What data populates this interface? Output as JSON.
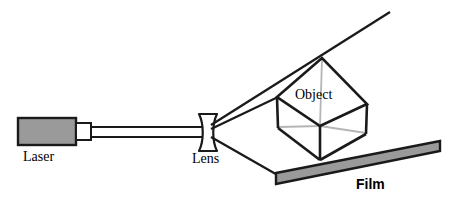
{
  "figure": {
    "width": 456,
    "height": 215,
    "background": "#ffffff"
  },
  "labels": {
    "laser": "Laser",
    "lens": "Lens",
    "object": "Object",
    "film": "Film"
  },
  "colors": {
    "stroke": "#1a1a1a",
    "laser_body_fill": "#9a9a9a",
    "film_fill": "#9a9a9a",
    "hidden_edge": "#b5b5b5",
    "nozzle_fill": "#ffffff",
    "background": "#ffffff"
  },
  "components": {
    "laser": {
      "name": "laser",
      "body": {
        "x": 17,
        "y": 117,
        "width": 60,
        "height": 29
      },
      "nozzle": {
        "x": 77,
        "y": 123,
        "width": 14,
        "height": 17
      },
      "beam_tube": {
        "x1": 91,
        "y1": 127,
        "x2": 200,
        "y2": 137
      }
    },
    "lens": {
      "name": "diverging-lens",
      "center_x": 208,
      "top_y": 113,
      "bottom_y": 152,
      "cap_half_width": 9,
      "waist_half_width": 3
    },
    "object": {
      "name": "cube-object",
      "shape": "isometric-cube",
      "top_vertex": [
        322,
        58
      ],
      "left_vertex": [
        277,
        97
      ],
      "right_vertex": [
        367,
        104
      ],
      "bottom_vertex": [
        320,
        160
      ],
      "center_vertex": [
        320,
        126
      ],
      "upper_left_back": [
        279,
        127
      ],
      "upper_right_back": [
        366,
        133
      ]
    },
    "film": {
      "name": "film-plate",
      "corners": [
        [
          276,
          173
        ],
        [
          440,
          142
        ],
        [
          440,
          151
        ],
        [
          276,
          184
        ]
      ]
    }
  },
  "beams": {
    "collimated": {
      "from": [
        91,
        132
      ],
      "to": [
        202,
        132
      ]
    },
    "upper_ray": {
      "from": [
        210,
        126
      ],
      "to": [
        390,
        12
      ]
    },
    "object_ray": {
      "from": [
        210,
        129
      ],
      "to": [
        277,
        97
      ]
    },
    "film_ray": {
      "from": [
        210,
        136
      ],
      "to": [
        280,
        176
      ]
    }
  }
}
